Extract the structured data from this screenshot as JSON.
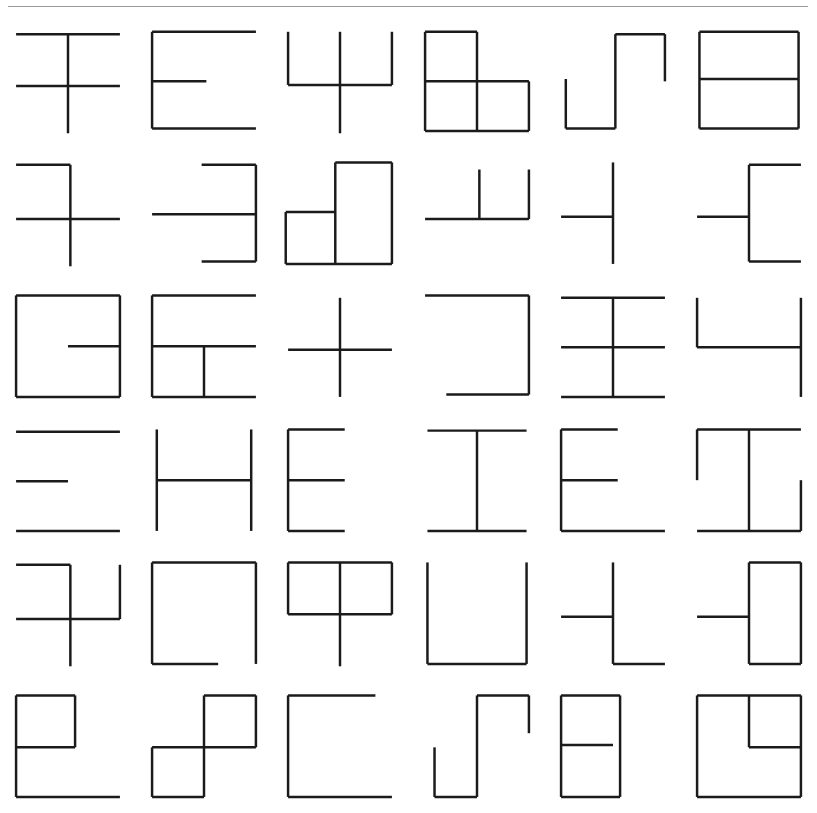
{
  "page": {
    "background_color": "#ffffff",
    "stroke_color": "#1b1b1b",
    "rule_color": "#9a9a9a",
    "width": 817,
    "height": 813
  },
  "top_rule": {
    "name": "horizontal-rule",
    "x": 8,
    "y": 6,
    "width": 800
  },
  "grid": {
    "rows": 6,
    "columns": 6,
    "cell_count": 36,
    "viewbox": "0 0 100 100"
  },
  "glyphs": [
    {
      "index": 1,
      "row": 1,
      "col": 1,
      "label": "glyph-r1c1",
      "description": "top horizontal, middle horizontal, long vertical through both extending below",
      "lines": [
        [
          6,
          12,
          94,
          12
        ],
        [
          6,
          56,
          94,
          56
        ],
        [
          50,
          12,
          50,
          96
        ]
      ]
    },
    {
      "index": 2,
      "row": 1,
      "col": 2,
      "label": "glyph-r1c2",
      "description": "E shape: left vertical with full top, half middle and full bottom horizontals",
      "lines": [
        [
          6,
          10,
          6,
          92
        ],
        [
          6,
          10,
          94,
          10
        ],
        [
          6,
          52,
          52,
          52
        ],
        [
          6,
          92,
          94,
          92
        ]
      ]
    },
    {
      "index": 3,
      "row": 1,
      "col": 3,
      "label": "glyph-r1c3",
      "description": "psi shape: middle horizontal with three upward verticals, centre vertical extends below",
      "lines": [
        [
          6,
          55,
          94,
          55
        ],
        [
          6,
          10,
          6,
          55
        ],
        [
          50,
          10,
          50,
          96
        ],
        [
          94,
          10,
          94,
          55
        ]
      ]
    },
    {
      "index": 4,
      "row": 1,
      "col": 4,
      "label": "glyph-r1c4",
      "description": "L tromino of three squares: top-left, bottom-left, bottom-right",
      "lines": [
        [
          6,
          10,
          50,
          10
        ],
        [
          6,
          10,
          6,
          94
        ],
        [
          50,
          10,
          50,
          94
        ],
        [
          6,
          52,
          94,
          52
        ],
        [
          94,
          52,
          94,
          94
        ],
        [
          6,
          94,
          94,
          94
        ]
      ]
    },
    {
      "index": 5,
      "row": 1,
      "col": 5,
      "label": "glyph-r1c5",
      "description": "S staircase: short left vertical, bottom horizontal, tall centre vertical, top horizontal, right vertical down",
      "lines": [
        [
          10,
          50,
          10,
          92
        ],
        [
          10,
          92,
          52,
          92
        ],
        [
          52,
          12,
          52,
          92
        ],
        [
          52,
          12,
          94,
          12
        ],
        [
          94,
          12,
          94,
          52
        ]
      ]
    },
    {
      "index": 6,
      "row": 1,
      "col": 6,
      "label": "glyph-r1c6",
      "description": "rectangle divided by a horizontal line through the middle",
      "lines": [
        [
          8,
          10,
          92,
          10
        ],
        [
          8,
          10,
          8,
          92
        ],
        [
          92,
          10,
          92,
          92
        ],
        [
          8,
          92,
          92,
          92
        ],
        [
          8,
          50,
          92,
          50
        ]
      ]
    },
    {
      "index": 7,
      "row": 2,
      "col": 1,
      "label": "glyph-r2c1",
      "description": "half top horizontal, full middle horizontal, vertical from top-right down past middle",
      "lines": [
        [
          6,
          10,
          52,
          10
        ],
        [
          6,
          56,
          94,
          56
        ],
        [
          52,
          10,
          52,
          96
        ]
      ]
    },
    {
      "index": 8,
      "row": 2,
      "col": 2,
      "label": "glyph-r2c2",
      "description": "mirrored E: right vertical with top, middle and bottom horizontals to the left",
      "lines": [
        [
          94,
          10,
          94,
          92
        ],
        [
          48,
          10,
          94,
          10
        ],
        [
          6,
          52,
          94,
          52
        ],
        [
          48,
          92,
          94,
          92
        ]
      ]
    },
    {
      "index": 9,
      "row": 2,
      "col": 3,
      "label": "glyph-r2c3",
      "description": "tall rectangle on the right plus a square at the lower left",
      "lines": [
        [
          46,
          8,
          94,
          8
        ],
        [
          46,
          8,
          46,
          94
        ],
        [
          94,
          8,
          94,
          94
        ],
        [
          4,
          50,
          46,
          50
        ],
        [
          4,
          50,
          4,
          94
        ],
        [
          4,
          94,
          94,
          94
        ]
      ]
    },
    {
      "index": 10,
      "row": 2,
      "col": 4,
      "label": "glyph-r2c4",
      "description": "horizontal line with two upward verticals at centre and right end",
      "lines": [
        [
          6,
          56,
          94,
          56
        ],
        [
          52,
          14,
          52,
          56
        ],
        [
          94,
          14,
          94,
          56
        ]
      ]
    },
    {
      "index": 11,
      "row": 2,
      "col": 5,
      "label": "glyph-r2c5",
      "description": "centre vertical with a horizontal stub on the left at mid-height",
      "lines": [
        [
          50,
          8,
          50,
          94
        ],
        [
          6,
          54,
          50,
          54
        ]
      ]
    },
    {
      "index": 12,
      "row": 2,
      "col": 6,
      "label": "glyph-r2c6",
      "description": "bracket: vertical with top and bottom horizontals to the right and a middle horizontal to the left",
      "lines": [
        [
          50,
          10,
          50,
          92
        ],
        [
          50,
          10,
          94,
          10
        ],
        [
          6,
          54,
          50,
          54
        ],
        [
          50,
          92,
          94,
          92
        ]
      ]
    },
    {
      "index": 13,
      "row": 3,
      "col": 1,
      "label": "glyph-r3c1",
      "description": "square with an inward horizontal stub from the right side at mid-height",
      "lines": [
        [
          6,
          8,
          94,
          8
        ],
        [
          6,
          8,
          6,
          94
        ],
        [
          94,
          8,
          94,
          94
        ],
        [
          6,
          94,
          94,
          94
        ],
        [
          50,
          51,
          94,
          51
        ]
      ]
    },
    {
      "index": 14,
      "row": 3,
      "col": 2,
      "label": "glyph-r3c2",
      "description": "E shape with an extra short vertical in the lower half",
      "lines": [
        [
          6,
          8,
          6,
          94
        ],
        [
          6,
          8,
          94,
          8
        ],
        [
          6,
          51,
          94,
          51
        ],
        [
          6,
          94,
          94,
          94
        ],
        [
          50,
          51,
          50,
          94
        ]
      ]
    },
    {
      "index": 15,
      "row": 3,
      "col": 3,
      "label": "glyph-r3c3",
      "description": "plus sign: full horizontal crossed by a full vertical",
      "lines": [
        [
          6,
          54,
          94,
          54
        ],
        [
          50,
          10,
          50,
          94
        ]
      ]
    },
    {
      "index": 16,
      "row": 3,
      "col": 4,
      "label": "glyph-r3c4",
      "description": "reversed C: top horizontal, right vertical, shorter bottom horizontal",
      "lines": [
        [
          6,
          8,
          94,
          8
        ],
        [
          94,
          8,
          94,
          92
        ],
        [
          24,
          92,
          94,
          92
        ]
      ]
    },
    {
      "index": 17,
      "row": 3,
      "col": 5,
      "label": "glyph-r3c5",
      "description": "three horizontals crossed by a centre vertical",
      "lines": [
        [
          6,
          10,
          94,
          10
        ],
        [
          6,
          52,
          94,
          52
        ],
        [
          6,
          94,
          94,
          94
        ],
        [
          50,
          10,
          50,
          94
        ]
      ]
    },
    {
      "index": 18,
      "row": 3,
      "col": 6,
      "label": "glyph-r3c6",
      "description": "U shape whose right vertical continues below the base",
      "lines": [
        [
          6,
          10,
          6,
          52
        ],
        [
          6,
          52,
          94,
          52
        ],
        [
          94,
          10,
          94,
          94
        ]
      ]
    },
    {
      "index": 19,
      "row": 4,
      "col": 1,
      "label": "glyph-r4c1",
      "description": "three horizontals with no vertical: long top, short middle, long bottom",
      "lines": [
        [
          6,
          10,
          94,
          10
        ],
        [
          6,
          52,
          50,
          52
        ],
        [
          6,
          94,
          94,
          94
        ]
      ]
    },
    {
      "index": 20,
      "row": 4,
      "col": 2,
      "label": "glyph-r4c2",
      "description": "H shape: two full verticals joined by a middle horizontal",
      "lines": [
        [
          10,
          8,
          10,
          94
        ],
        [
          90,
          8,
          90,
          94
        ],
        [
          10,
          51,
          90,
          51
        ]
      ]
    },
    {
      "index": 21,
      "row": 4,
      "col": 3,
      "label": "glyph-r4c3",
      "description": "E shape with half width horizontals",
      "lines": [
        [
          6,
          8,
          6,
          94
        ],
        [
          6,
          8,
          54,
          8
        ],
        [
          6,
          51,
          54,
          51
        ],
        [
          6,
          94,
          54,
          94
        ]
      ]
    },
    {
      "index": 22,
      "row": 4,
      "col": 4,
      "label": "glyph-r4c4",
      "description": "I shape: top and bottom horizontals joined by a centre vertical",
      "lines": [
        [
          8,
          9,
          92,
          9
        ],
        [
          8,
          94,
          92,
          94
        ],
        [
          50,
          9,
          50,
          94
        ]
      ]
    },
    {
      "index": 23,
      "row": 4,
      "col": 5,
      "label": "glyph-r4c5",
      "description": "E shape with short top and middle horizontals and a long bottom horizontal",
      "lines": [
        [
          6,
          8,
          6,
          94
        ],
        [
          6,
          8,
          54,
          8
        ],
        [
          6,
          51,
          54,
          51
        ],
        [
          6,
          94,
          94,
          94
        ]
      ]
    },
    {
      "index": 24,
      "row": 4,
      "col": 6,
      "label": "glyph-r4c6",
      "description": "top and bottom horizontals, centre vertical, upper-left vertical and lower-right vertical",
      "lines": [
        [
          6,
          8,
          94,
          8
        ],
        [
          6,
          94,
          94,
          94
        ],
        [
          50,
          8,
          50,
          94
        ],
        [
          6,
          8,
          6,
          51
        ],
        [
          94,
          51,
          94,
          94
        ]
      ]
    },
    {
      "index": 25,
      "row": 5,
      "col": 1,
      "label": "glyph-r5c1",
      "description": "top-left horizontal, centre vertical extending down, middle horizontal, right vertical rising",
      "lines": [
        [
          6,
          10,
          52,
          10
        ],
        [
          52,
          10,
          52,
          96
        ],
        [
          6,
          56,
          94,
          56
        ],
        [
          94,
          10,
          94,
          56
        ]
      ]
    },
    {
      "index": 26,
      "row": 5,
      "col": 2,
      "label": "glyph-r5c2",
      "description": "square outline with a gap at the bottom-right corner",
      "lines": [
        [
          6,
          8,
          94,
          8
        ],
        [
          6,
          8,
          6,
          94
        ],
        [
          94,
          8,
          94,
          94
        ],
        [
          6,
          94,
          62,
          94
        ]
      ]
    },
    {
      "index": 27,
      "row": 5,
      "col": 3,
      "label": "glyph-r5c3",
      "description": "upper rectangle divided by a centre vertical that continues below",
      "lines": [
        [
          6,
          8,
          94,
          8
        ],
        [
          6,
          8,
          6,
          52
        ],
        [
          94,
          8,
          94,
          52
        ],
        [
          6,
          52,
          94,
          52
        ],
        [
          50,
          8,
          50,
          96
        ]
      ]
    },
    {
      "index": 28,
      "row": 5,
      "col": 4,
      "label": "glyph-r5c4",
      "description": "U shape: two verticals joined by a bottom horizontal",
      "lines": [
        [
          8,
          8,
          8,
          94
        ],
        [
          92,
          8,
          92,
          94
        ],
        [
          8,
          94,
          92,
          94
        ]
      ]
    },
    {
      "index": 29,
      "row": 5,
      "col": 5,
      "label": "glyph-r5c5",
      "description": "vertical with a middle horizontal to the left and a bottom horizontal to the right",
      "lines": [
        [
          50,
          8,
          50,
          94
        ],
        [
          6,
          54,
          50,
          54
        ],
        [
          50,
          94,
          94,
          94
        ]
      ]
    },
    {
      "index": 30,
      "row": 5,
      "col": 6,
      "label": "glyph-r5c6",
      "description": "tall rectangle on the right with a horizontal stub extending to the left",
      "lines": [
        [
          50,
          8,
          94,
          8
        ],
        [
          50,
          8,
          50,
          94
        ],
        [
          94,
          8,
          94,
          94
        ],
        [
          50,
          94,
          94,
          94
        ],
        [
          6,
          54,
          50,
          54
        ]
      ]
    },
    {
      "index": 31,
      "row": 6,
      "col": 1,
      "label": "glyph-r6c1",
      "description": "small square at top-left attached to a long left vertical and bottom horizontal",
      "lines": [
        [
          6,
          8,
          56,
          8
        ],
        [
          6,
          8,
          6,
          94
        ],
        [
          56,
          8,
          56,
          52
        ],
        [
          6,
          52,
          56,
          52
        ],
        [
          6,
          94,
          94,
          94
        ]
      ]
    },
    {
      "index": 32,
      "row": 6,
      "col": 2,
      "label": "glyph-r6c2",
      "description": "two diagonally offset squares meeting at a corner",
      "lines": [
        [
          50,
          8,
          94,
          8
        ],
        [
          50,
          8,
          50,
          52
        ],
        [
          94,
          8,
          94,
          52
        ],
        [
          6,
          52,
          94,
          52
        ],
        [
          6,
          52,
          6,
          94
        ],
        [
          50,
          52,
          50,
          94
        ],
        [
          6,
          94,
          50,
          94
        ]
      ]
    },
    {
      "index": 33,
      "row": 6,
      "col": 3,
      "label": "glyph-r6c3",
      "description": "C shape: top horizontal, left vertical, bottom horizontal",
      "lines": [
        [
          6,
          8,
          80,
          8
        ],
        [
          6,
          8,
          6,
          94
        ],
        [
          6,
          94,
          94,
          94
        ]
      ]
    },
    {
      "index": 34,
      "row": 6,
      "col": 4,
      "label": "glyph-r6c4",
      "description": "S staircase: short left vertical, bottom horizontal, tall centre vertical, top horizontal, right vertical",
      "lines": [
        [
          14,
          52,
          14,
          94
        ],
        [
          14,
          94,
          50,
          94
        ],
        [
          50,
          8,
          50,
          94
        ],
        [
          50,
          8,
          94,
          8
        ],
        [
          94,
          8,
          94,
          40
        ]
      ]
    },
    {
      "index": 35,
      "row": 6,
      "col": 5,
      "label": "glyph-r6c5",
      "description": "tall rectangle with a horizontal stub extending right at mid-height",
      "lines": [
        [
          6,
          8,
          56,
          8
        ],
        [
          6,
          8,
          6,
          94
        ],
        [
          56,
          8,
          56,
          94
        ],
        [
          6,
          94,
          56,
          94
        ],
        [
          6,
          50,
          50,
          50
        ]
      ]
    },
    {
      "index": 36,
      "row": 6,
      "col": 6,
      "label": "glyph-r6c6",
      "description": "large square with a smaller square nested in its upper-right corner",
      "lines": [
        [
          6,
          8,
          94,
          8
        ],
        [
          6,
          8,
          6,
          94
        ],
        [
          94,
          8,
          94,
          94
        ],
        [
          6,
          94,
          94,
          94
        ],
        [
          50,
          8,
          50,
          52
        ],
        [
          50,
          52,
          94,
          52
        ]
      ]
    }
  ]
}
